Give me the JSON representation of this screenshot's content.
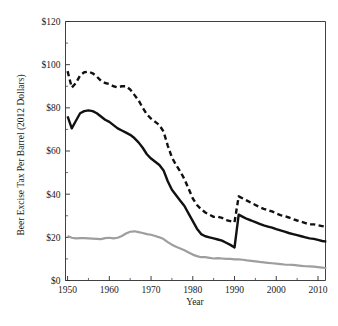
{
  "chart_data": {
    "type": "line",
    "title": "",
    "xlabel": "Year",
    "ylabel": "Beer Excise Tax Per Barrel (2012 Dollars)",
    "xlim": [
      1949.5,
      2011.8
    ],
    "ylim": [
      0,
      120
    ],
    "xticks": [
      1950,
      1960,
      1970,
      1980,
      1990,
      2000,
      2010
    ],
    "xtick_labels": [
      "1950",
      "1960",
      "1970",
      "1980",
      "1990",
      "2000",
      "2010"
    ],
    "xticks_minor": [
      1955,
      1965,
      1975,
      1985,
      1995,
      2005
    ],
    "yticks": [
      0,
      20,
      40,
      60,
      80,
      100,
      120
    ],
    "ytick_labels": [
      "$0",
      "$20",
      "$40",
      "$60",
      "$80",
      "$100",
      "$120"
    ],
    "yticks_minor": [
      10,
      30,
      50,
      70,
      90,
      110
    ],
    "grid": false,
    "legend": "none",
    "x": [
      1950,
      1951,
      1952,
      1953,
      1954,
      1955,
      1956,
      1957,
      1958,
      1959,
      1960,
      1961,
      1962,
      1963,
      1964,
      1965,
      1966,
      1967,
      1968,
      1969,
      1970,
      1971,
      1972,
      1973,
      1974,
      1975,
      1976,
      1977,
      1978,
      1979,
      1980,
      1981,
      1982,
      1983,
      1984,
      1985,
      1986,
      1987,
      1988,
      1989,
      1990,
      1991,
      1992,
      1993,
      1994,
      1995,
      1996,
      1997,
      1998,
      1999,
      2000,
      2001,
      2002,
      2003,
      2004,
      2005,
      2006,
      2007,
      2008,
      2009,
      2010,
      2011,
      2012
    ],
    "series": [
      {
        "name": "total-tax-dashed",
        "style": "dashed",
        "color": "#111111",
        "width": 2.4,
        "values": [
          97.0,
          89.4,
          91.5,
          95.0,
          96.5,
          96.8,
          96.0,
          94.5,
          92.5,
          91.5,
          91.0,
          90.0,
          89.5,
          90.0,
          90.0,
          88.5,
          86.0,
          83.5,
          80.0,
          77.0,
          75.0,
          73.5,
          72.0,
          69.0,
          62.5,
          57.0,
          53.5,
          50.5,
          47.0,
          42.5,
          38.0,
          35.0,
          33.0,
          31.5,
          30.5,
          29.5,
          29.5,
          29.0,
          28.0,
          27.5,
          27.0,
          39.0,
          38.0,
          37.0,
          36.0,
          35.0,
          34.0,
          33.2,
          32.5,
          32.0,
          31.0,
          30.3,
          29.8,
          29.2,
          28.5,
          27.8,
          27.2,
          26.6,
          26.0,
          26.0,
          25.6,
          25.2,
          25.0
        ]
      },
      {
        "name": "federal-tax-solid",
        "style": "solid",
        "color": "#111111",
        "width": 2.4,
        "values": [
          76.0,
          70.5,
          74.0,
          77.5,
          78.5,
          78.8,
          78.5,
          77.5,
          76.0,
          74.5,
          73.5,
          72.0,
          70.5,
          69.5,
          68.5,
          67.5,
          66.0,
          64.0,
          61.5,
          58.5,
          56.5,
          55.0,
          53.5,
          51.0,
          46.0,
          42.0,
          39.5,
          37.0,
          34.5,
          31.0,
          27.5,
          24.0,
          21.5,
          20.5,
          20.0,
          19.5,
          19.0,
          18.5,
          17.5,
          16.5,
          15.3,
          30.5,
          29.5,
          28.5,
          27.8,
          27.0,
          26.2,
          25.5,
          25.0,
          24.5,
          23.8,
          23.2,
          22.6,
          22.0,
          21.5,
          21.0,
          20.5,
          20.0,
          19.5,
          19.3,
          18.8,
          18.3,
          18.0
        ]
      },
      {
        "name": "state-tax-grey",
        "style": "solid",
        "color": "#9e9e9e",
        "width": 2.2,
        "values": [
          20.6,
          19.8,
          19.5,
          19.6,
          19.6,
          19.5,
          19.4,
          19.3,
          19.2,
          19.6,
          19.8,
          19.5,
          19.8,
          20.6,
          21.8,
          22.6,
          22.8,
          22.4,
          22.0,
          21.5,
          21.2,
          20.6,
          20.0,
          19.2,
          17.8,
          16.6,
          15.6,
          14.8,
          14.0,
          13.0,
          12.0,
          11.3,
          10.8,
          10.8,
          10.5,
          10.2,
          10.4,
          10.2,
          10.0,
          10.0,
          9.8,
          9.8,
          9.6,
          9.3,
          9.1,
          8.9,
          8.6,
          8.4,
          8.2,
          8.0,
          7.8,
          7.6,
          7.4,
          7.3,
          7.2,
          7.0,
          6.8,
          6.6,
          6.5,
          6.4,
          6.2,
          6.0,
          5.8
        ]
      }
    ]
  },
  "figure": {
    "background": "#ffffff",
    "axis_color": "#2b2b2b"
  }
}
